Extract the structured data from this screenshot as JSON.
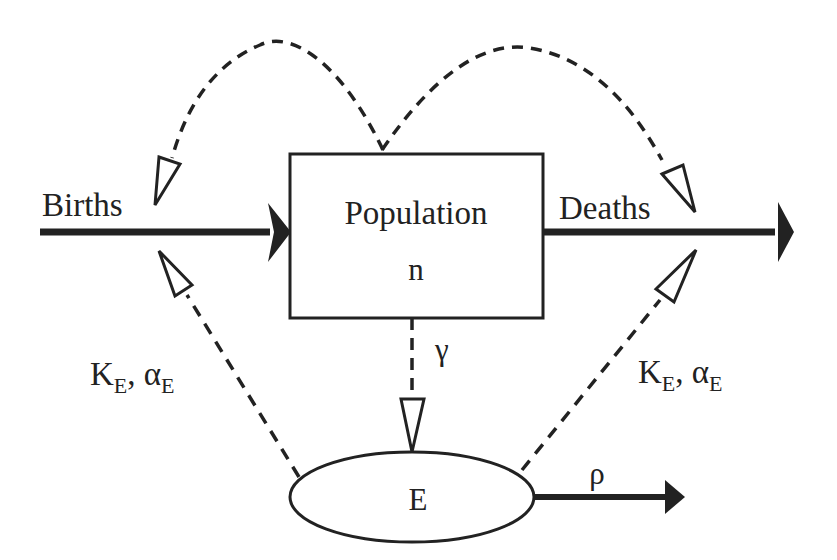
{
  "diagram": {
    "type": "compartment-flow-diagram",
    "nodes": {
      "population": {
        "title": "Population",
        "symbol": "n",
        "shape": "rectangle"
      },
      "environment": {
        "symbol": "E",
        "shape": "ellipse"
      }
    },
    "flows": {
      "births": {
        "label": "Births",
        "style": "solid",
        "direction": "into population"
      },
      "deaths": {
        "label": "Deaths",
        "style": "solid",
        "direction": "out of population"
      },
      "decay": {
        "label": "ρ",
        "style": "solid",
        "direction": "out of E"
      }
    },
    "influences": {
      "gamma": {
        "label": "γ",
        "from": "population",
        "to": "environment",
        "style": "dashed"
      },
      "left_k": {
        "main": "K",
        "sub1": "E",
        "sep": ", ",
        "alpha": "α",
        "sub2": "E",
        "from": "environment",
        "to": "births",
        "style": "dashed"
      },
      "right_k": {
        "main": "K",
        "sub1": "E",
        "sep": ", ",
        "alpha": "α",
        "sub2": "E",
        "from": "environment",
        "to": "deaths",
        "style": "dashed"
      },
      "pop_to_births": {
        "from": "population",
        "to": "births",
        "style": "dashed-curve"
      },
      "pop_to_deaths": {
        "from": "population",
        "to": "deaths",
        "style": "dashed-curve"
      }
    },
    "colors": {
      "ink": "#222222",
      "background": "#ffffff"
    }
  }
}
